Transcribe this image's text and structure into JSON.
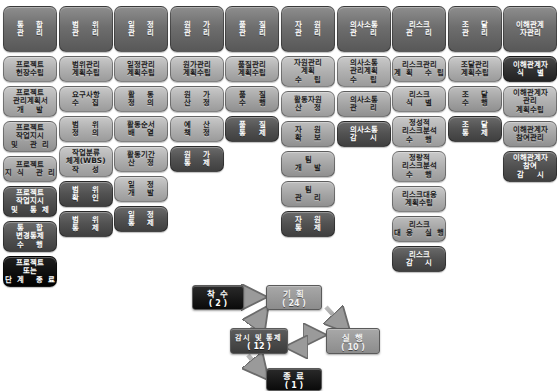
{
  "diagram": {
    "colors": {
      "initiating": "#222222",
      "planning": "#b0b0b0",
      "executing": "#a5a5a5",
      "monitoring": "#515151",
      "closing": "#000000",
      "header": "#6e6e6e"
    }
  },
  "columns": [
    {
      "header": {
        "line1": "통 합",
        "line2": "관 리"
      },
      "cells": [
        {
          "group": "planning",
          "lines": [
            "프로젝트",
            "헌장수립"
          ]
        },
        {
          "group": "planning",
          "lines": [
            "프로젝트",
            "관리계획서",
            "개 발"
          ]
        },
        {
          "group": "executing",
          "lines": [
            "프로젝트",
            "작업지시",
            "및 관리"
          ]
        },
        {
          "group": "executing",
          "lines": [
            "프로젝트",
            "지식 관리"
          ]
        },
        {
          "group": "monitoring",
          "lines": [
            "프로젝트",
            "작업지시",
            "및 통제"
          ]
        },
        {
          "group": "monitoring",
          "lines": [
            "통 합",
            "변경통제",
            "수 행"
          ]
        },
        {
          "group": "closing",
          "lines": [
            "프로젝트",
            "또는",
            "단계 종료"
          ]
        }
      ]
    },
    {
      "header": {
        "line1": "범 위",
        "line2": "관 리"
      },
      "cells": [
        {
          "group": "planning",
          "lines": [
            "범위관리",
            "계획수립"
          ]
        },
        {
          "group": "planning",
          "lines": [
            "요구사항",
            "수 집"
          ]
        },
        {
          "group": "planning",
          "lines": [
            "범 위",
            "정 의"
          ]
        },
        {
          "group": "planning",
          "lines": [
            "작업분류",
            "체계(WBS)",
            "작 성"
          ]
        },
        {
          "group": "monitoring",
          "lines": [
            "범 위",
            "확 인"
          ]
        },
        {
          "group": "monitoring",
          "lines": [
            "범 위",
            "통 제"
          ]
        }
      ]
    },
    {
      "header": {
        "line1": "일 정",
        "line2": "관 리"
      },
      "cells": [
        {
          "group": "planning",
          "lines": [
            "일정관리",
            "계획수립"
          ]
        },
        {
          "group": "planning",
          "lines": [
            "활 동",
            "정 의"
          ]
        },
        {
          "group": "planning",
          "lines": [
            "활동순서",
            "배 열"
          ]
        },
        {
          "group": "planning",
          "lines": [
            "활동기간",
            "산 정"
          ]
        },
        {
          "group": "planning",
          "lines": [
            "일 정",
            "개 발"
          ]
        },
        {
          "group": "monitoring",
          "lines": [
            "일 정",
            "통 제"
          ]
        }
      ]
    },
    {
      "header": {
        "line1": "원 가",
        "line2": "관 리"
      },
      "cells": [
        {
          "group": "planning",
          "lines": [
            "원가관리",
            "계획수립"
          ]
        },
        {
          "group": "planning",
          "lines": [
            "원 가",
            "산 정"
          ]
        },
        {
          "group": "planning",
          "lines": [
            "예 산",
            "책 정"
          ]
        },
        {
          "group": "monitoring",
          "lines": [
            "원 가",
            "통 제"
          ]
        }
      ]
    },
    {
      "header": {
        "line1": "품 질",
        "line2": "관 리"
      },
      "cells": [
        {
          "group": "planning",
          "lines": [
            "품질관리",
            "계획수립"
          ]
        },
        {
          "group": "executing",
          "lines": [
            "품 질",
            "수 행"
          ]
        },
        {
          "group": "monitoring",
          "lines": [
            "품 질",
            "통 제"
          ]
        }
      ]
    },
    {
      "header": {
        "line1": "자 원",
        "line2": "관 리"
      },
      "cells": [
        {
          "group": "planning",
          "lines": [
            "자원관리",
            "계획",
            "수 립"
          ]
        },
        {
          "group": "planning",
          "lines": [
            "활동자원",
            "산 정"
          ]
        },
        {
          "group": "executing",
          "lines": [
            "자 원",
            "확 보"
          ]
        },
        {
          "group": "executing",
          "lines": [
            "팀",
            "개 발"
          ]
        },
        {
          "group": "executing",
          "lines": [
            "팀",
            "관 리"
          ]
        },
        {
          "group": "monitoring",
          "lines": [
            "자 원",
            "통 제"
          ]
        }
      ]
    },
    {
      "header": {
        "line1": "의사소통",
        "line2": "관 리"
      },
      "cells": [
        {
          "group": "planning",
          "lines": [
            "의사소통",
            "관리계획",
            "수 립"
          ]
        },
        {
          "group": "executing",
          "lines": [
            "의사소통",
            "관 리"
          ]
        },
        {
          "group": "monitoring",
          "lines": [
            "의사소통",
            "감 시"
          ]
        }
      ]
    },
    {
      "header": {
        "line1": "리스크",
        "line2": "관 리"
      },
      "cells": [
        {
          "group": "planning",
          "lines": [
            "리스크관리",
            "계획 수립"
          ]
        },
        {
          "group": "planning",
          "lines": [
            "리스크",
            "식 별"
          ]
        },
        {
          "group": "planning",
          "lines": [
            "정성적",
            "리스크분석",
            "수 행"
          ]
        },
        {
          "group": "planning",
          "lines": [
            "정량적",
            "리스크분석",
            "수 행"
          ]
        },
        {
          "group": "planning",
          "lines": [
            "리스크대응",
            "계획수립"
          ]
        },
        {
          "group": "executing",
          "lines": [
            "리스크",
            "대응 실행"
          ]
        },
        {
          "group": "monitoring",
          "lines": [
            "리스크",
            "감 시"
          ]
        }
      ]
    },
    {
      "header": {
        "line1": "조 달",
        "line2": "관 리"
      },
      "cells": [
        {
          "group": "planning",
          "lines": [
            "조달관리",
            "계획수립"
          ]
        },
        {
          "group": "executing",
          "lines": [
            "조 달",
            "수 행"
          ]
        },
        {
          "group": "monitoring",
          "lines": [
            "조 달",
            "통 제"
          ]
        }
      ]
    },
    {
      "header": {
        "line1": "이해관계",
        "line2": "자관리"
      },
      "cells": [
        {
          "group": "initiating",
          "lines": [
            "이해관계자",
            "식 별"
          ]
        },
        {
          "group": "planning",
          "lines": [
            "이해관계자",
            "관리",
            "계획수립"
          ]
        },
        {
          "group": "executing",
          "lines": [
            "이해관계자",
            "참여관리"
          ]
        },
        {
          "group": "monitoring",
          "lines": [
            "이해관계자",
            "참여",
            "감 시"
          ]
        }
      ]
    }
  ],
  "flow": {
    "nodes": [
      {
        "id": "initiating",
        "label": "착 수",
        "count": "( 2 )",
        "style": "f-dark"
      },
      {
        "id": "planning",
        "label": "기 획",
        "count": "( 24 )",
        "style": "f-lite"
      },
      {
        "id": "executing",
        "label": "실 행",
        "count": "( 10 )",
        "style": "f-lite"
      },
      {
        "id": "monitoring",
        "label": "감시 및 통제",
        "count": "( 12 )",
        "style": "f-mid"
      },
      {
        "id": "closing",
        "label": "종 료",
        "count": "( 1 )",
        "style": "f-dark"
      }
    ]
  }
}
